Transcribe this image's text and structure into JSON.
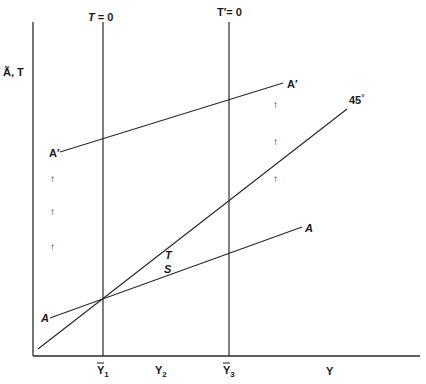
{
  "diagram": {
    "y_axis_label": "Ã, T",
    "x_axis_label": "Y",
    "vertical_lines": [
      {
        "label": "T = 0",
        "x_tick": "Ȳ1"
      },
      {
        "label": "T′= 0",
        "x_tick": "Ȳ3"
      }
    ],
    "x_ticks": [
      "Ȳ1",
      "Y2",
      "Ȳ3"
    ],
    "x_tick_main": {
      "y1": "Y",
      "y1_sub": "1",
      "y2": "Y",
      "y2_sub": "2",
      "y3": "Y",
      "y3_sub": "3"
    },
    "lines": {
      "a_prime_left": "A′",
      "a_prime_right": "A′",
      "a_left": "A",
      "a_right": "A",
      "forty_five": "45",
      "degree": "°"
    },
    "labels": {
      "t_label": "T",
      "s_label": "S",
      "t_zero": "T",
      "t_zero_eq": "= 0",
      "t_prime_zero": "T′= 0"
    },
    "arrows": {
      "glyph": "↑"
    }
  }
}
